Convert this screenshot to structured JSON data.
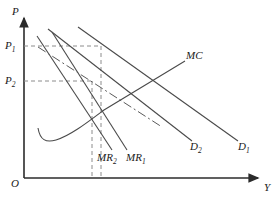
{
  "figure": {
    "type": "economics-diagram",
    "width": 278,
    "height": 202,
    "line_color": "#3a3a3a",
    "dash_color": "#8c8c8c",
    "axis_color": "#2b2b2b"
  },
  "axes": {
    "y_axis_label": "P",
    "x_axis_label": "Y",
    "origin_label": "O",
    "origin": {
      "x": 24,
      "y": 178
    },
    "y_top": 14,
    "x_right": 262
  },
  "price_ticks": [
    {
      "id": "p1",
      "label": "P",
      "sub": "1",
      "y": 46,
      "dash_to_x": 101
    },
    {
      "id": "p2",
      "label": "P",
      "sub": "2",
      "y": 81,
      "dash_to_x": 93
    }
  ],
  "quantity_guides": [
    {
      "id": "q2",
      "x": 92,
      "from_y": 81,
      "to_y": 178
    },
    {
      "id": "q1",
      "x": 101,
      "from_y": 46,
      "to_y": 178
    }
  ],
  "curves": [
    {
      "id": "mc",
      "label": "MC",
      "label_sub": "",
      "style": "solid",
      "label_x": 186,
      "label_y": 55,
      "note": "marginal cost, upward sloping"
    },
    {
      "id": "d1",
      "label": "D",
      "label_sub": "1",
      "style": "solid",
      "label_x": 238,
      "label_y": 146,
      "note": "demand curve 1, outer"
    },
    {
      "id": "d2",
      "label": "D",
      "label_sub": "2",
      "style": "solid",
      "label_x": 190,
      "label_y": 146,
      "note": "demand curve 2, inner"
    },
    {
      "id": "mr1",
      "label": "MR",
      "label_sub": "1",
      "style": "solid",
      "label_x": 126,
      "label_y": 157,
      "note": "marginal revenue 1"
    },
    {
      "id": "mr2",
      "label": "MR",
      "label_sub": "2",
      "style": "solid",
      "label_x": 98,
      "label_y": 157,
      "note": "marginal revenue 2"
    },
    {
      "id": "dd",
      "label": "",
      "label_sub": "",
      "style": "dash-dot",
      "note": "dash-dot perceived demand curve"
    },
    {
      "id": "avg-cost",
      "label": "",
      "label_sub": "",
      "style": "solid-curve",
      "note": "u-shaped cost curve lower left"
    }
  ]
}
